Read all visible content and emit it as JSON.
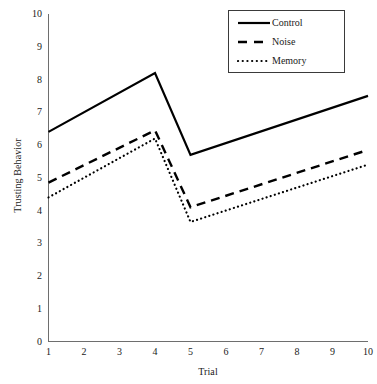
{
  "chart_data": {
    "type": "line",
    "title": "",
    "xlabel": "Trial",
    "ylabel": "Trusting Behavior",
    "x": [
      1,
      2,
      3,
      4,
      5,
      6,
      7,
      8,
      9,
      10
    ],
    "xlim": [
      1,
      10
    ],
    "ylim": [
      0,
      10
    ],
    "xticks": [
      "1",
      "2",
      "3",
      "4",
      "5",
      "6",
      "7",
      "8",
      "9",
      "10"
    ],
    "yticks": [
      "0",
      "1",
      "2",
      "3",
      "4",
      "5",
      "6",
      "7",
      "8",
      "9",
      "10"
    ],
    "grid": false,
    "legend_position": "top-right",
    "series": [
      {
        "name": "Control",
        "style": "solid",
        "color": "#000000",
        "x": [
          1,
          4,
          5,
          10
        ],
        "values": [
          6.4,
          8.2,
          5.7,
          7.5
        ]
      },
      {
        "name": "Noise",
        "style": "dashed",
        "color": "#000000",
        "x": [
          1,
          4,
          5,
          10
        ],
        "values": [
          4.85,
          6.45,
          4.1,
          5.85
        ]
      },
      {
        "name": "Memory",
        "style": "dotted",
        "color": "#000000",
        "x": [
          1,
          4,
          5,
          10
        ],
        "values": [
          4.4,
          6.2,
          3.65,
          5.4
        ]
      }
    ]
  },
  "legend": {
    "entries": [
      {
        "label": "Control"
      },
      {
        "label": "Noise"
      },
      {
        "label": "Memory"
      }
    ]
  },
  "colors": {
    "line": "#000000",
    "axis": "#6e6e6e",
    "text": "#1a1a1a",
    "background": "#ffffff"
  }
}
